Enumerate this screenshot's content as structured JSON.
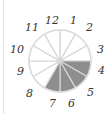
{
  "diagram": {
    "type": "clock-fraction-circle",
    "sectors": 12,
    "shaded_from_hour": 3,
    "shaded_to_hour": 7,
    "shaded_count": 4,
    "colors": {
      "shaded": "#8e8e8e",
      "lines": "#d6d6d6",
      "outline": "#dcdcdc",
      "labels": "#333333"
    },
    "labels": [
      "12",
      "1",
      "2",
      "3",
      "4",
      "5",
      "6",
      "7",
      "8",
      "9",
      "10",
      "11"
    ]
  }
}
